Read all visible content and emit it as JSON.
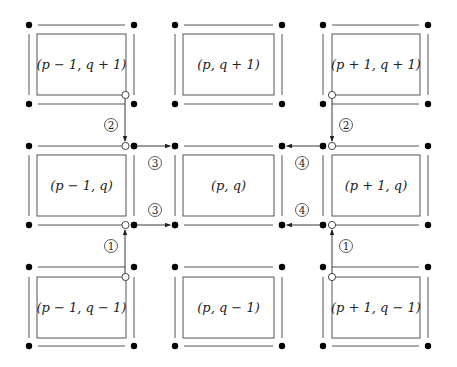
{
  "diagram": {
    "colors": {
      "line": "#555555",
      "dot": "#000000",
      "arrow": "#222222",
      "background": "#ffffff"
    },
    "cells": [
      {
        "id": "cell-0-0",
        "label": "(p − 1, q + 1)",
        "row": 0,
        "col": 0
      },
      {
        "id": "cell-0-1",
        "label": "(p, q + 1)",
        "row": 0,
        "col": 1
      },
      {
        "id": "cell-0-2",
        "label": "(p + 1, q + 1)",
        "row": 0,
        "col": 2
      },
      {
        "id": "cell-1-0",
        "label": "(p − 1, q)",
        "row": 1,
        "col": 0
      },
      {
        "id": "cell-1-1",
        "label": "(p, q)",
        "row": 1,
        "col": 1
      },
      {
        "id": "cell-1-2",
        "label": "(p + 1, q)",
        "row": 1,
        "col": 2
      },
      {
        "id": "cell-2-0",
        "label": "(p − 1, q − 1)",
        "row": 2,
        "col": 0
      },
      {
        "id": "cell-2-1",
        "label": "(p, q − 1)",
        "row": 2,
        "col": 1
      },
      {
        "id": "cell-2-2",
        "label": "(p + 1, q − 1)",
        "row": 2,
        "col": 2
      }
    ],
    "steps": [
      {
        "id": "step-2-left",
        "label": "2",
        "from": "(p − 1, q + 1)",
        "to": "(p − 1, q)",
        "direction": "down"
      },
      {
        "id": "step-3-top",
        "label": "3",
        "from": "(p − 1, q)",
        "to": "(p, q)",
        "direction": "right"
      },
      {
        "id": "step-3-bottom",
        "label": "3",
        "from": "(p − 1, q)",
        "to": "(p, q)",
        "direction": "right"
      },
      {
        "id": "step-1-left",
        "label": "1",
        "from": "(p − 1, q − 1)",
        "to": "(p − 1, q)",
        "direction": "up"
      },
      {
        "id": "step-2-right",
        "label": "2",
        "from": "(p + 1, q + 1)",
        "to": "(p + 1, q)",
        "direction": "down"
      },
      {
        "id": "step-4-top",
        "label": "4",
        "from": "(p + 1, q)",
        "to": "(p, q)",
        "direction": "left"
      },
      {
        "id": "step-4-bottom",
        "label": "4",
        "from": "(p + 1, q)",
        "to": "(p, q)",
        "direction": "left"
      },
      {
        "id": "step-1-right",
        "label": "1",
        "from": "(p + 1, q − 1)",
        "to": "(p + 1, q)",
        "direction": "up"
      }
    ]
  }
}
